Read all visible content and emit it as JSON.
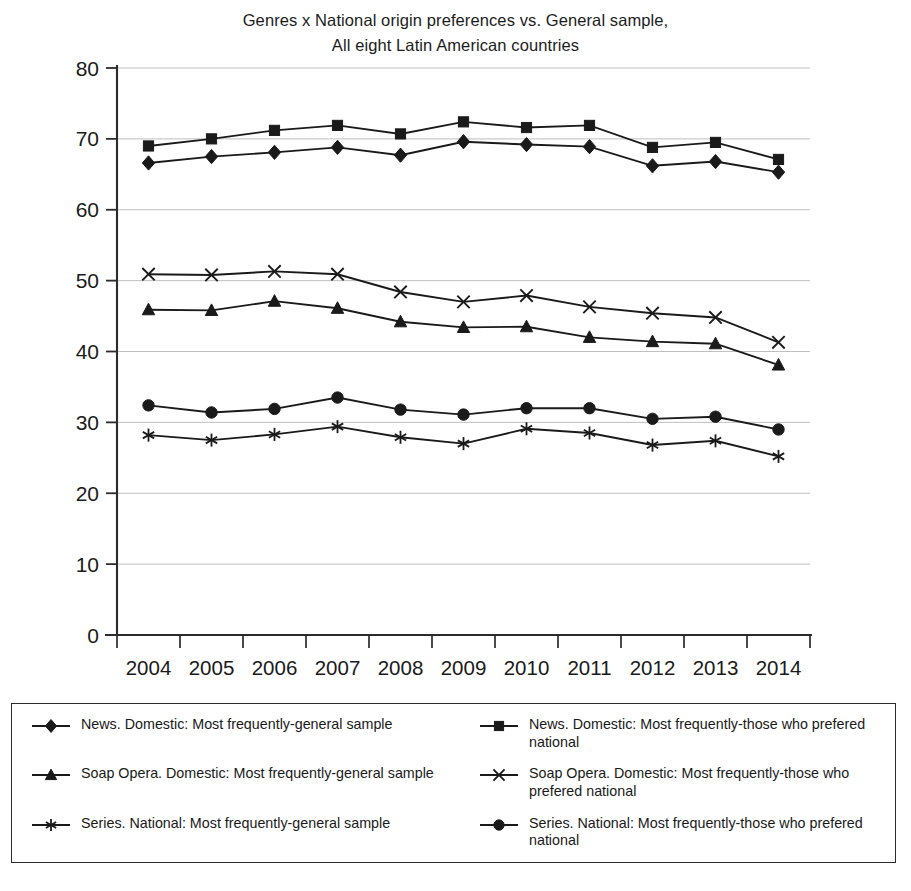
{
  "chart_data": {
    "type": "line",
    "title": "Genres x National origin preferences vs. General sample, All eight Latin American countries",
    "title_line1": "Genres x National origin preferences vs. General sample,",
    "title_line2": "All eight Latin American countries",
    "xlabel": "",
    "ylabel": "",
    "categories": [
      "2004",
      "2005",
      "2006",
      "2007",
      "2008",
      "2009",
      "2010",
      "2011",
      "2012",
      "2013",
      "2014"
    ],
    "x": [
      2004,
      2005,
      2006,
      2007,
      2008,
      2009,
      2010,
      2011,
      2012,
      2013,
      2014
    ],
    "ylim": [
      0,
      80
    ],
    "yticks": [
      0,
      10,
      20,
      30,
      40,
      50,
      60,
      70,
      80
    ],
    "ytick_labels": [
      "0",
      "10",
      "20",
      "30",
      "40",
      "50",
      "60",
      "70",
      "80"
    ],
    "grid": "horizontal",
    "legend_position": "bottom",
    "series": [
      {
        "name": "News. Domestic: Most frequently-general sample",
        "marker": "diamond",
        "color": "#1a1a1a",
        "values": [
          66.6,
          67.5,
          68.1,
          68.8,
          67.7,
          69.6,
          69.2,
          68.9,
          66.2,
          66.8,
          65.3
        ]
      },
      {
        "name": "News. Domestic: Most frequently-those who prefered national",
        "marker": "square",
        "color": "#1a1a1a",
        "values": [
          69.0,
          70.0,
          71.2,
          71.9,
          70.7,
          72.4,
          71.6,
          71.9,
          68.8,
          69.5,
          67.1
        ]
      },
      {
        "name": "Soap Opera. Domestic: Most frequently-general sample",
        "marker": "triangle",
        "color": "#1a1a1a",
        "values": [
          45.9,
          45.8,
          47.1,
          46.1,
          44.2,
          43.4,
          43.5,
          42.0,
          41.4,
          41.1,
          38.1
        ]
      },
      {
        "name": "Soap Opera. Domestic: Most frequently-those who prefered national",
        "marker": "x",
        "color": "#1a1a1a",
        "values": [
          50.9,
          50.8,
          51.3,
          50.9,
          48.4,
          47.0,
          47.9,
          46.3,
          45.4,
          44.8,
          41.3
        ]
      },
      {
        "name": "Series. National: Most frequently-general sample",
        "marker": "asterisk",
        "color": "#1a1a1a",
        "values": [
          28.2,
          27.5,
          28.3,
          29.4,
          27.9,
          27.0,
          29.1,
          28.5,
          26.8,
          27.4,
          25.2
        ]
      },
      {
        "name": "Series. National: Most frequently-those who prefered national",
        "marker": "circle",
        "color": "#1a1a1a",
        "values": [
          32.4,
          31.4,
          31.9,
          33.5,
          31.8,
          31.1,
          32.0,
          32.0,
          30.5,
          30.8,
          29.0
        ]
      }
    ]
  },
  "legend": {
    "items": [
      {
        "label": "News. Domestic: Most frequently-general sample",
        "marker": "diamond",
        "column": "left"
      },
      {
        "label": "News. Domestic: Most frequently-those who prefered national",
        "marker": "square",
        "column": "right"
      },
      {
        "label": "Soap Opera. Domestic: Most frequently-general sample",
        "marker": "triangle",
        "column": "left"
      },
      {
        "label": "Soap Opera. Domestic: Most frequently-those who prefered national",
        "marker": "x",
        "column": "right"
      },
      {
        "label": "Series. National: Most frequently-general sample",
        "marker": "asterisk",
        "column": "left"
      },
      {
        "label": "Series. National: Most frequently-those who prefered national",
        "marker": "circle",
        "column": "right"
      }
    ]
  },
  "style": {
    "line_color": "#1a1a1a",
    "grid_color": "#b9b9b9",
    "axis_color": "#2b2b2b",
    "background": "#ffffff"
  }
}
